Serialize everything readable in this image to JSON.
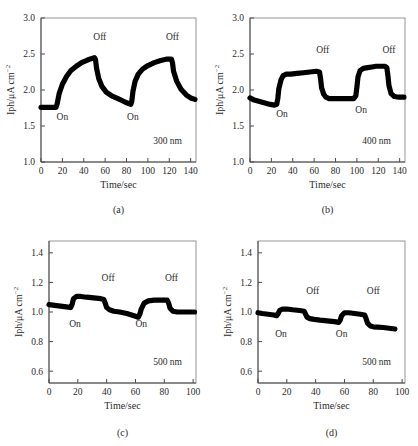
{
  "figure": {
    "name": "photocurrent-response-figure",
    "axis_titles": {
      "x": "Time/sec",
      "y_main": "Iph/μA cm",
      "y_exponent": "−2"
    },
    "annotations": {
      "on": "On",
      "off": "Off"
    }
  },
  "panels": [
    {
      "id": "a",
      "letter": "(a)",
      "wavelength": "300 nm",
      "xlabel": "Time/sec",
      "ylabel": "Iph/μA cm",
      "xticks": [
        0,
        20,
        40,
        60,
        80,
        100,
        120,
        140
      ],
      "yticks": [
        "3.0",
        "2.5",
        "2.0",
        "1.5",
        "1.0"
      ],
      "xlim": [
        0,
        145
      ],
      "ylim": [
        1.0,
        3.0
      ],
      "on_labels": [
        {
          "text": "On",
          "x": 20,
          "y": 1.58
        },
        {
          "text": "On",
          "x": 86,
          "y": 1.58
        }
      ],
      "off_labels": [
        {
          "text": "Off",
          "x": 55,
          "y": 2.7
        },
        {
          "text": "Off",
          "x": 123,
          "y": 2.7
        }
      ]
    },
    {
      "id": "b",
      "letter": "(b)",
      "wavelength": "400 nm",
      "xlabel": "Time/sec",
      "ylabel": "Iph/μA cm",
      "xticks": [
        0,
        20,
        40,
        60,
        80,
        100,
        120,
        140
      ],
      "yticks": [
        "3.0",
        "2.5",
        "2.0",
        "1.5",
        "1.0"
      ],
      "xlim": [
        0,
        145
      ],
      "ylim": [
        1.0,
        3.0
      ],
      "on_labels": [
        {
          "text": "On",
          "x": 30,
          "y": 1.62
        },
        {
          "text": "On",
          "x": 104,
          "y": 1.68
        }
      ],
      "off_labels": [
        {
          "text": "Off",
          "x": 68,
          "y": 2.52
        },
        {
          "text": "Off",
          "x": 130,
          "y": 2.52
        }
      ]
    },
    {
      "id": "c",
      "letter": "(c)",
      "wavelength": "500 nm",
      "xlabel": "Time/sec",
      "ylabel": "Iph/μA cm",
      "xticks": [
        0,
        20,
        40,
        60,
        80,
        100
      ],
      "yticks": [
        "1.4",
        "1.2",
        "1.0",
        "0.8",
        "0.6"
      ],
      "xlim": [
        0,
        102
      ],
      "ylim": [
        0.52,
        1.48
      ],
      "on_labels": [
        {
          "text": "On",
          "x": 18,
          "y": 0.9
        },
        {
          "text": "On",
          "x": 64,
          "y": 0.9
        }
      ],
      "off_labels": [
        {
          "text": "Off",
          "x": 41,
          "y": 1.21
        },
        {
          "text": "Off",
          "x": 85,
          "y": 1.21
        }
      ]
    },
    {
      "id": "d",
      "letter": "(d)",
      "wavelength": "500 nm",
      "xlabel": "Time/sec",
      "ylabel": "Iph/μA cm",
      "xticks": [
        0,
        20,
        40,
        60,
        80,
        100
      ],
      "yticks": [
        "1.4",
        "1.2",
        "1.0",
        "0.8",
        "0.6"
      ],
      "xlim": [
        0,
        102
      ],
      "ylim": [
        0.52,
        1.48
      ],
      "on_labels": [
        {
          "text": "On",
          "x": 16,
          "y": 0.83
        },
        {
          "text": "On",
          "x": 58,
          "y": 0.83
        }
      ],
      "off_labels": [
        {
          "text": "Off",
          "x": 38,
          "y": 1.12
        },
        {
          "text": "Off",
          "x": 80,
          "y": 1.12
        }
      ]
    }
  ],
  "chart_data": [
    {
      "type": "line",
      "panel": "a",
      "title": "300 nm",
      "xlabel": "Time/sec",
      "ylabel": "Iph/μA cm⁻²",
      "xlim": [
        0,
        145
      ],
      "ylim": [
        1.0,
        3.0
      ],
      "xticks": [
        0,
        20,
        40,
        60,
        80,
        100,
        120,
        140
      ],
      "yticks": [
        1.0,
        1.5,
        2.0,
        2.5,
        3.0
      ],
      "grid": false,
      "legend": "none",
      "series": [
        {
          "name": "photocurrent",
          "x": [
            0,
            5,
            10,
            14,
            15,
            17,
            20,
            24,
            28,
            33,
            38,
            44,
            50,
            51,
            52,
            54,
            57,
            61,
            66,
            72,
            79,
            84,
            85,
            86,
            88,
            91,
            95,
            100,
            106,
            112,
            118,
            122,
            123,
            124,
            127,
            131,
            136,
            140,
            144
          ],
          "y": [
            1.76,
            1.76,
            1.76,
            1.76,
            1.8,
            1.95,
            2.08,
            2.19,
            2.27,
            2.33,
            2.38,
            2.42,
            2.45,
            2.42,
            2.3,
            2.16,
            2.05,
            1.97,
            1.92,
            1.88,
            1.83,
            1.8,
            1.85,
            1.98,
            2.12,
            2.22,
            2.29,
            2.34,
            2.38,
            2.41,
            2.43,
            2.43,
            2.38,
            2.26,
            2.12,
            2.01,
            1.93,
            1.89,
            1.87
          ]
        }
      ]
    },
    {
      "type": "line",
      "panel": "b",
      "title": "400 nm",
      "xlabel": "Time/sec",
      "ylabel": "Iph/μA cm⁻²",
      "xlim": [
        0,
        145
      ],
      "ylim": [
        1.0,
        3.0
      ],
      "xticks": [
        0,
        20,
        40,
        60,
        80,
        100,
        120,
        140
      ],
      "yticks": [
        1.0,
        1.5,
        2.0,
        2.5,
        3.0
      ],
      "grid": false,
      "legend": "none",
      "series": [
        {
          "name": "photocurrent",
          "x": [
            0,
            4,
            9,
            14,
            19,
            23,
            25,
            26,
            27,
            29,
            31,
            34,
            38,
            44,
            50,
            56,
            62,
            65,
            66,
            67,
            69,
            71,
            74,
            79,
            85,
            91,
            97,
            99,
            100,
            101,
            103,
            106,
            110,
            114,
            118,
            122,
            126,
            128,
            129,
            130,
            132,
            135,
            139,
            144
          ],
          "y": [
            1.89,
            1.86,
            1.84,
            1.82,
            1.8,
            1.79,
            1.8,
            1.88,
            2.02,
            2.14,
            2.2,
            2.22,
            2.22,
            2.23,
            2.24,
            2.25,
            2.26,
            2.25,
            2.16,
            2.03,
            1.94,
            1.9,
            1.88,
            1.88,
            1.88,
            1.88,
            1.88,
            1.92,
            2.04,
            2.18,
            2.27,
            2.3,
            2.31,
            2.32,
            2.33,
            2.33,
            2.33,
            2.31,
            2.2,
            2.06,
            1.95,
            1.91,
            1.9,
            1.9
          ]
        }
      ]
    },
    {
      "type": "line",
      "panel": "c",
      "title": "500 nm",
      "xlabel": "Time/sec",
      "ylabel": "Iph/μA cm⁻²",
      "xlim": [
        0,
        102
      ],
      "ylim": [
        0.52,
        1.48
      ],
      "xticks": [
        0,
        20,
        40,
        60,
        80,
        100
      ],
      "yticks": [
        0.6,
        0.8,
        1.0,
        1.2,
        1.4
      ],
      "grid": false,
      "legend": "none",
      "series": [
        {
          "name": "photocurrent",
          "x": [
            0,
            4,
            8,
            12,
            15,
            16,
            17,
            19,
            22,
            26,
            31,
            36,
            38,
            39,
            40,
            42,
            45,
            49,
            54,
            59,
            62,
            63,
            64,
            66,
            69,
            73,
            78,
            82,
            83,
            84,
            86,
            89,
            93,
            97,
            101
          ],
          "y": [
            1.05,
            1.045,
            1.04,
            1.035,
            1.03,
            1.05,
            1.09,
            1.105,
            1.105,
            1.1,
            1.095,
            1.09,
            1.085,
            1.06,
            1.03,
            1.015,
            1.005,
            1.0,
            0.99,
            0.975,
            0.965,
            0.985,
            1.02,
            1.06,
            1.075,
            1.08,
            1.08,
            1.08,
            1.06,
            1.025,
            1.005,
            1.0,
            1.0,
            1.0,
            1.0
          ]
        }
      ]
    },
    {
      "type": "line",
      "panel": "d",
      "title": "500 nm",
      "xlabel": "Time/sec",
      "ylabel": "Iph/μA cm⁻²",
      "xlim": [
        0,
        102
      ],
      "ylim": [
        0.52,
        1.48
      ],
      "xticks": [
        0,
        20,
        40,
        60,
        80,
        100
      ],
      "yticks": [
        0.6,
        0.8,
        1.0,
        1.2,
        1.4
      ],
      "grid": false,
      "legend": "none",
      "series": [
        {
          "name": "photocurrent",
          "x": [
            0,
            3,
            7,
            11,
            13,
            14,
            15,
            17,
            20,
            24,
            29,
            32,
            33,
            34,
            36,
            39,
            43,
            48,
            53,
            56,
            57,
            58,
            60,
            63,
            67,
            71,
            74,
            75,
            76,
            78,
            80,
            83,
            87,
            91,
            95
          ],
          "y": [
            0.995,
            0.99,
            0.985,
            0.98,
            0.975,
            0.99,
            1.01,
            1.02,
            1.02,
            1.015,
            1.01,
            1.005,
            0.985,
            0.965,
            0.955,
            0.95,
            0.945,
            0.94,
            0.935,
            0.93,
            0.945,
            0.975,
            0.995,
            0.995,
            0.99,
            0.985,
            0.98,
            0.955,
            0.925,
            0.905,
            0.9,
            0.898,
            0.895,
            0.89,
            0.885
          ]
        }
      ]
    }
  ]
}
